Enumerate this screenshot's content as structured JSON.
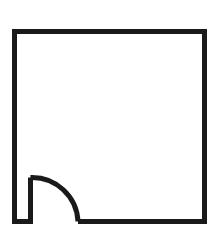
{
  "figure": {
    "label": "D",
    "caption_position": "top-left",
    "type": "floor-plan-outline",
    "colors": {
      "background": "#ffffff",
      "stroke": "#1a1a1a",
      "label": "#1a1a1a"
    },
    "canvas": {
      "width": 218,
      "height": 239
    },
    "geometry": {
      "stroke_width": 5,
      "outer_rect": {
        "left": 14.5,
        "top": 31.5,
        "right": 204.5,
        "bottom": 221.5
      },
      "notch": {
        "channel_left_x": 14.5,
        "channel_inner_x": 30.5,
        "channel_top_y": 177.5,
        "channel_bottom_y": 221.5
      },
      "arc": {
        "start_x": 30.5,
        "start_y": 177.5,
        "end_x": 78,
        "end_y": 221.5,
        "radius": 46,
        "center_x": 30.5,
        "center_y": 221.5,
        "sweep": "quarter-circle",
        "direction": "clockwise"
      }
    },
    "icon_names": {
      "outline": "room-outline-icon",
      "door": "door-swing-arc-icon"
    }
  }
}
